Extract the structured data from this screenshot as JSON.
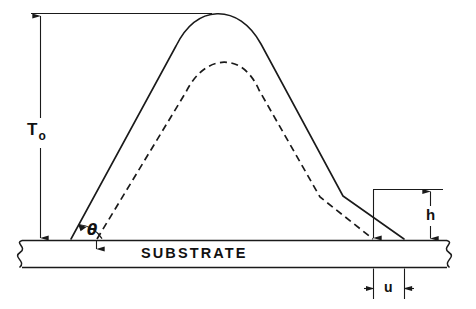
{
  "figure": {
    "type": "technical-line-diagram",
    "background_color": "#ffffff",
    "line_color": "#1a1a1a"
  },
  "labels": {
    "thickness_symbol": "T",
    "thickness_subscript": "o",
    "thickness_full": "To",
    "angle_symbol": "θ",
    "height_symbol": "h",
    "undercut_symbol": "u",
    "substrate": "SUBSTRATE"
  },
  "elements": {
    "solid_profile_name": "as-developed resist profile",
    "dashed_profile_name": "reference resist profile",
    "substrate_name": "substrate slab",
    "top_reference_line_name": "top reference datum line"
  },
  "dimensions": {
    "T0": {
      "label": "To",
      "description": "full resist thickness measured from substrate surface to top datum",
      "orientation": "vertical",
      "arrow_style": "double-ended"
    },
    "h": {
      "label": "h",
      "description": "height of the undercut step on the right sidewall",
      "orientation": "vertical",
      "arrow_style": "double-ended"
    },
    "u": {
      "label": "u",
      "description": "lateral undercut distance at the substrate surface",
      "orientation": "horizontal",
      "arrow_style": "double-ended-inward"
    },
    "theta": {
      "label": "θ",
      "description": "sidewall angle between the resist profile and the substrate surface",
      "orientation": "angular",
      "arrow_style": "arc-with-arrowhead"
    }
  },
  "geometry": {
    "canvas_width": 476,
    "canvas_height": 309,
    "substrate_top_y": 240,
    "substrate_bottom_y": 268,
    "top_datum_y": 14,
    "solid_peak_x": 238,
    "solid_peak_y": 14,
    "dashed_peak_y": 62,
    "solid_left_foot_x": 71,
    "solid_right_foot_x": 404,
    "dashed_left_foot_x": 97,
    "dashed_right_foot_x": 373
  }
}
